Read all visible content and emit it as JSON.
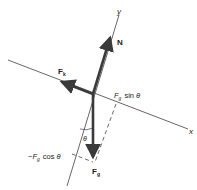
{
  "diagram": {
    "colors": {
      "background": "#ffffff",
      "axis": "#555555",
      "vector": "#3a3a3a",
      "dashed": "#444444",
      "text": "#222222"
    },
    "axes": {
      "x_label": "x",
      "y_label": "y"
    },
    "vectors": {
      "normal": {
        "label": "N"
      },
      "friction": {
        "label": "F",
        "subscript": "k"
      },
      "gravity": {
        "label": "F",
        "subscript": "g"
      }
    },
    "components": {
      "parallel": {
        "prefix": "",
        "symbol": "F",
        "subscript": "g",
        "func": "sin",
        "angle": "θ"
      },
      "perpendicular": {
        "prefix": "−",
        "symbol": "F",
        "subscript": "g",
        "func": "cos",
        "angle": "θ"
      }
    },
    "angle_label": "θ"
  }
}
